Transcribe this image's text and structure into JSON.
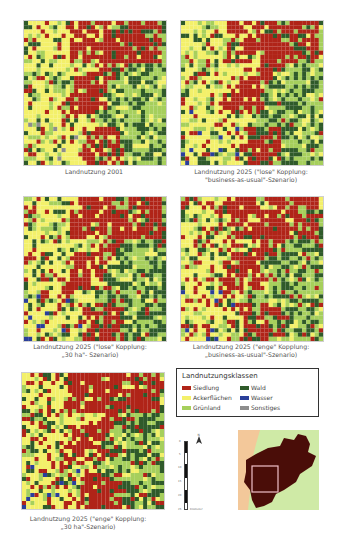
{
  "figure": {
    "maps": [
      {
        "id": "map-2001",
        "caption_lines": [
          "Landnutzung 2001"
        ],
        "scenario": "2001"
      },
      {
        "id": "map-2025-lose-bau",
        "caption_lines": [
          "Landnutzung 2025 (\"lose\" Kopplung:",
          "\"business-as-usual\"-Szenario)"
        ],
        "scenario": "lose-bau"
      },
      {
        "id": "map-2025-lose-30ha",
        "caption_lines": [
          "Landnutzung 2025 (\"lose\" Kopplung:",
          "„30 ha\"- Szenario)"
        ],
        "scenario": "lose-30ha"
      },
      {
        "id": "map-2025-enge-bau",
        "caption_lines": [
          "Landnutzung 2025 (\"enge\" Kopplung:",
          "„business-as-usual\"-Szenario)"
        ],
        "scenario": "enge-bau"
      },
      {
        "id": "map-2025-enge-30ha",
        "caption_lines": [
          "Landnutzung 2025 (\"enge\" Kopplung:",
          "„30 ha\"-Szenario)"
        ],
        "scenario": "enge-30ha"
      }
    ],
    "legend": {
      "title": "Landnutzungsklassen",
      "items": [
        {
          "label": "Siedlung",
          "color": "#b02418"
        },
        {
          "label": "Wald",
          "color": "#2f5a2a"
        },
        {
          "label": "Ackerflächen",
          "color": "#f3f06a"
        },
        {
          "label": "Wasser",
          "color": "#2a3f9a"
        },
        {
          "label": "Grünland",
          "color": "#a6cf5c"
        },
        {
          "label": "Sonstiges",
          "color": "#8d8d8d"
        }
      ]
    },
    "scale_bar": {
      "unit": "Kilometer",
      "ticks": [
        "0",
        "5",
        "10",
        "15",
        "20",
        "25"
      ]
    },
    "north_arrow": "N",
    "inset": {
      "region_color": "#4a0d08",
      "bg_left_color": "#f3c89a",
      "bg_right_color": "#cfeaa6",
      "frame_color": "#f0c0c8"
    }
  }
}
